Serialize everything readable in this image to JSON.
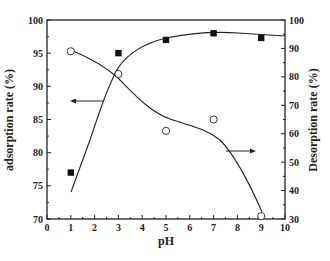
{
  "chart_data": {
    "type": "scatter",
    "title": "",
    "xlabel": "pH",
    "ylabel": "adsorption rate (%)",
    "y2label": "Desorption rate (%)",
    "xlim": [
      0,
      10
    ],
    "ylim": [
      70,
      100
    ],
    "y2lim": [
      30,
      100
    ],
    "x_ticks": [
      "0",
      "1",
      "2",
      "3",
      "4",
      "5",
      "6",
      "7",
      "8",
      "9",
      "10"
    ],
    "y_ticks": [
      "70",
      "75",
      "80",
      "85",
      "90",
      "95",
      "100"
    ],
    "y2_ticks": [
      "30",
      "40",
      "50",
      "60",
      "70",
      "80",
      "90",
      "100"
    ],
    "grid": false,
    "legend": null,
    "series": [
      {
        "name": "adsorption rate",
        "axis": "left",
        "marker": "filled-square",
        "x": [
          1,
          3,
          5,
          7,
          9
        ],
        "values": [
          77,
          95,
          97,
          98,
          97.3
        ],
        "fit_curve": "sigmoidal, rising then plateau near 97.5"
      },
      {
        "name": "Desorption rate",
        "axis": "right",
        "marker": "open-circle",
        "x": [
          1,
          3,
          5,
          7,
          9
        ],
        "values": [
          89,
          81,
          61,
          65,
          31
        ],
        "fit_curve": "decreasing with shoulder near pH 5-6, steep drop to pH 9"
      }
    ],
    "annotations": [
      {
        "type": "arrow",
        "direction": "left",
        "meaning": "adsorption curve reads on left axis",
        "near": "pH 1.5, 88%"
      },
      {
        "type": "arrow",
        "direction": "right",
        "meaning": "desorption curve reads on right axis",
        "near": "pH 7.5, 55%"
      }
    ]
  }
}
